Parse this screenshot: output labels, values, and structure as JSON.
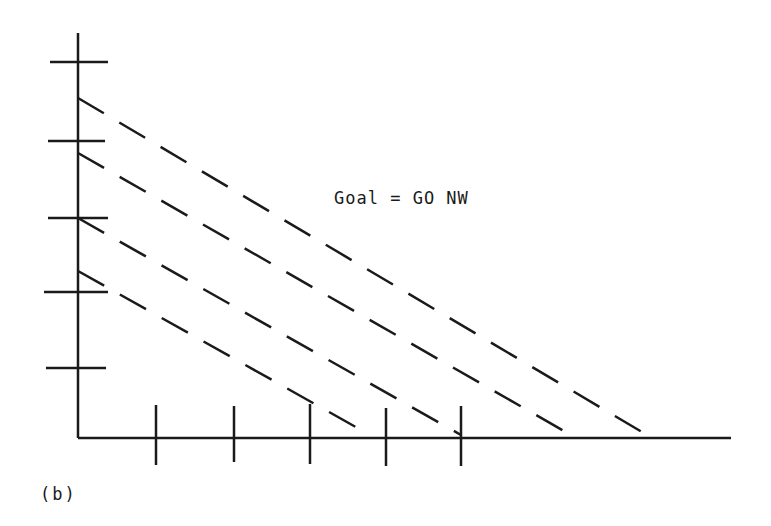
{
  "figure": {
    "label": "(b)",
    "annotation": "Goal = GO NW",
    "stroke_color": "#1a1a1a"
  },
  "axes": {
    "origin": [
      78,
      438
    ],
    "y_axis_top": 33,
    "x_axis_right": 731,
    "y_ticks": [
      62,
      141,
      218,
      292,
      368
    ],
    "x_ticks": [
      156,
      234,
      310,
      386,
      461
    ]
  },
  "dashed_lines": [
    {
      "start": [
        78,
        98
      ],
      "end": [
        647,
        435
      ]
    },
    {
      "start": [
        78,
        153
      ],
      "end": [
        571,
        435
      ]
    },
    {
      "start": [
        78,
        218
      ],
      "end": [
        461,
        435
      ]
    },
    {
      "start": [
        78,
        271
      ],
      "end": [
        370,
        435
      ]
    }
  ]
}
